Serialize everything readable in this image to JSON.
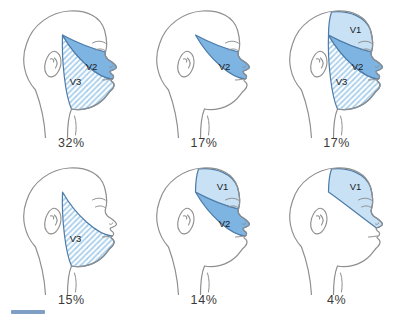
{
  "colors": {
    "v1_fill": "#c8e1f5",
    "v2_fill": "#7eb4e2",
    "v3_hatch_line": "#a5cdeb",
    "v3_background": "#ffffff",
    "region_stroke": "#4d7ca8",
    "head_outline": "#8f8f8f",
    "region_label_text": "#1c1c1c",
    "percent_text": "#3a3a3a",
    "crop_artifact": "#7da0c4"
  },
  "figures": [
    {
      "regions": [
        {
          "id": "V2",
          "label": "V2"
        },
        {
          "id": "V3",
          "label": "V3"
        }
      ],
      "percent": "32%"
    },
    {
      "regions": [
        {
          "id": "V2",
          "label": "V2"
        }
      ],
      "percent": "17%"
    },
    {
      "regions": [
        {
          "id": "V1",
          "label": "V1"
        },
        {
          "id": "V2",
          "label": "V2"
        },
        {
          "id": "V3",
          "label": "V3"
        }
      ],
      "percent": "17%"
    },
    {
      "regions": [
        {
          "id": "V3",
          "label": "V3"
        }
      ],
      "percent": "15%"
    },
    {
      "regions": [
        {
          "id": "V1",
          "label": "V1"
        },
        {
          "id": "V2",
          "label": "V2"
        }
      ],
      "percent": "14%"
    },
    {
      "regions": [
        {
          "id": "V1",
          "label": "V1"
        }
      ],
      "percent": "4%"
    }
  ]
}
